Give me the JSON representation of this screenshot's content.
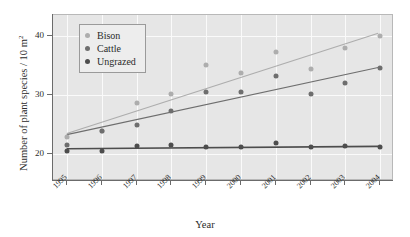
{
  "chart_data": {
    "type": "scatter",
    "title": "",
    "xlabel": "Year",
    "ylabel": "Number of plant species / 10 m",
    "ylabel_superscript": "2",
    "categories": [
      "1995",
      "1996",
      "1997",
      "1998",
      "1999",
      "2000",
      "2001",
      "2002",
      "2003",
      "2004"
    ],
    "x": [
      1995,
      1996,
      1997,
      1998,
      1999,
      2000,
      2001,
      2002,
      2003,
      2004
    ],
    "xlim": [
      1994.6,
      2004.4
    ],
    "ylim": [
      15.5,
      43.5
    ],
    "yticks": [
      20,
      30,
      40
    ],
    "ytick_labels": [
      "20",
      "30",
      "40"
    ],
    "xticks": [
      1995,
      1996,
      1997,
      1998,
      1999,
      2000,
      2001,
      2002,
      2003,
      2004
    ],
    "grid": true,
    "legend_position": "top-left",
    "series": [
      {
        "name": "Bison",
        "color": "#adadad",
        "values": [
          23.0,
          23.9,
          28.6,
          30.1,
          35.1,
          33.7,
          37.3,
          34.4,
          37.9,
          40.0
        ],
        "trendline": {
          "y_start": 23.4,
          "y_end": 40.4
        }
      },
      {
        "name": "Cattle",
        "color": "#6e6e6e",
        "values": [
          21.6,
          23.9,
          25.0,
          27.4,
          30.6,
          30.6,
          33.3,
          30.2,
          32.0,
          34.5
        ],
        "trendline": {
          "y_start": 23.2,
          "y_end": 34.6
        }
      },
      {
        "name": "Ungrazed",
        "color": "#4d4d4d",
        "values": [
          20.5,
          20.6,
          21.4,
          21.5,
          21.2,
          21.3,
          22.0,
          21.3,
          21.4,
          21.2
        ],
        "trendline": {
          "y_start": 20.8,
          "y_end": 21.2
        }
      }
    ]
  },
  "legend": {
    "items": [
      {
        "label": "Bison",
        "color": "#adadad"
      },
      {
        "label": "Cattle",
        "color": "#6e6e6e"
      },
      {
        "label": "Ungrazed",
        "color": "#4d4d4d"
      }
    ]
  },
  "colors": {
    "plot_background": "#e6e6e6",
    "gridline": "#fafafa",
    "axis": "#6b6b6b",
    "text": "#2b2b2b",
    "bison": "#adadad",
    "cattle": "#6e6e6e",
    "ungrazed": "#4d4d4d"
  }
}
